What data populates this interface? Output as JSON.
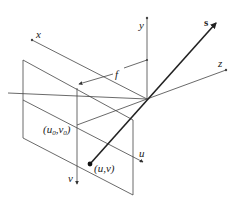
{
  "diagram": {
    "type": "pinhole-camera-geometry",
    "labels": {
      "x_axis": "x",
      "y_axis": "y",
      "z_axis": "z",
      "ray": "s",
      "focal_length": "f",
      "u_axis": "u",
      "v_axis": "v",
      "principal_point": "(u0,v0)",
      "principal_point_u": "(u",
      "principal_point_sub0": "0",
      "principal_point_v": ",v",
      "principal_point_sub0b": "0",
      "principal_point_close": ")",
      "image_point": "(u,v)"
    },
    "colors": {
      "lines": "#444444",
      "ray": "#222222",
      "background": "#ffffff"
    }
  }
}
